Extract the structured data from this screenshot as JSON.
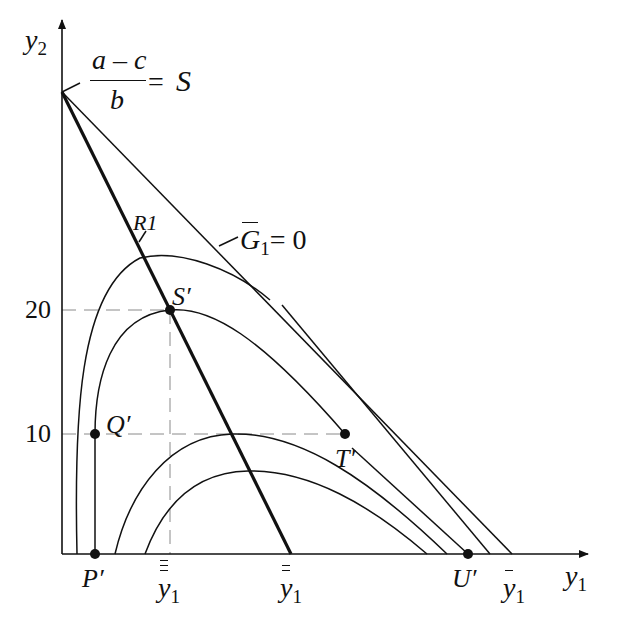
{
  "diagram": {
    "axes": {
      "x_label": "y",
      "x_label_sub": "1",
      "y_label": "y",
      "y_label_sub": "2"
    },
    "y_ticks": [
      {
        "label": "20",
        "y": 310
      },
      {
        "label": "10",
        "y": 434
      }
    ],
    "intercept_label": {
      "numerator": "a – c",
      "denominator": "b",
      "equals": "=",
      "name": "S"
    },
    "line_labels": {
      "reaction": "R1",
      "gain_zero": "G",
      "gain_zero_sub": "1",
      "gain_zero_eq": "= 0"
    },
    "points": {
      "S_prime": "S′",
      "Q_prime": "Q′",
      "T_prime": "T′",
      "P_prime": "P′",
      "U_prime": "U′"
    },
    "x_axis_markers": {
      "triple_bar": "y",
      "double_bar": "y",
      "single_bar": "y",
      "sub": "1"
    },
    "colors": {
      "ink": "#111111",
      "guide": "#8a8a8a",
      "background": "#ffffff"
    }
  }
}
